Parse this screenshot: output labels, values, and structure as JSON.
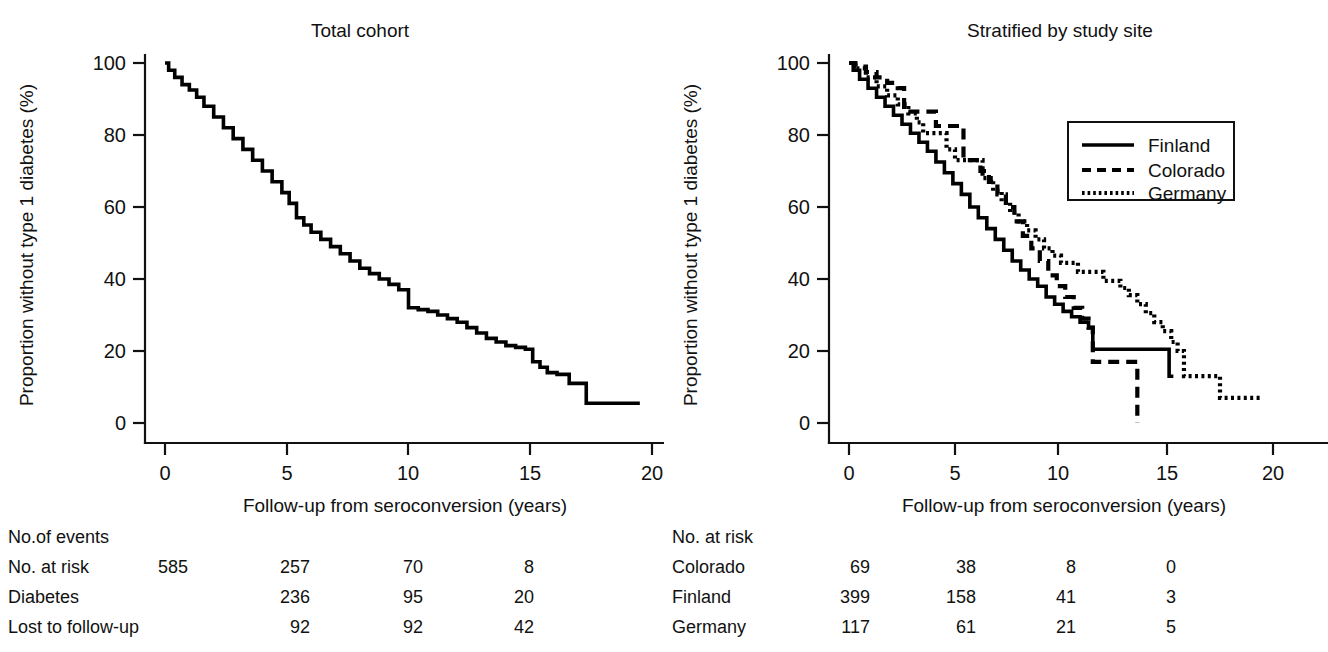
{
  "figure": {
    "axis_label_x": "Follow-up from seroconversion (years)",
    "axis_label_y": "Proportion without type 1 diabetes (%)",
    "x_ticks": [
      "0",
      "5",
      "10",
      "15",
      "20"
    ],
    "y_ticks": [
      "0",
      "20",
      "40",
      "60",
      "80",
      "100"
    ]
  },
  "panels": [
    {
      "title": "Total cohort",
      "risk_table": {
        "header": "No.of events",
        "rows": [
          {
            "label": "No. at risk",
            "values": [
              "585",
              "257",
              "70",
              "8"
            ]
          },
          {
            "label": "Diabetes",
            "values": [
              "",
              "236",
              "95",
              "20"
            ]
          },
          {
            "label": "Lost to follow-up",
            "values": [
              "",
              "92",
              "92",
              "42"
            ]
          }
        ]
      }
    },
    {
      "title": "Stratified by study site",
      "legend": [
        {
          "label": "Finland",
          "style": "solid"
        },
        {
          "label": "Colorado",
          "style": "dashed"
        },
        {
          "label": "Germany",
          "style": "dotted"
        }
      ],
      "risk_table": {
        "header": "No. at risk",
        "rows": [
          {
            "label": "Colorado",
            "values": [
              "69",
              "38",
              "8",
              "0"
            ]
          },
          {
            "label": "Finland",
            "values": [
              "399",
              "158",
              "41",
              "3"
            ]
          },
          {
            "label": "Germany",
            "values": [
              "117",
              "61",
              "21",
              "5"
            ]
          }
        ]
      }
    }
  ],
  "chart_data": [
    {
      "type": "line",
      "title": "Total cohort",
      "xlabel": "Follow-up from seroconversion (years)",
      "ylabel": "Proportion without type 1 diabetes (%)",
      "xlim": [
        0,
        20.5
      ],
      "ylim": [
        0,
        100
      ],
      "grid": false,
      "legend": "none",
      "series": [
        {
          "name": "Total cohort",
          "style": "solid",
          "x": [
            0,
            0.15,
            0.4,
            0.7,
            1,
            1.3,
            1.6,
            2,
            2.4,
            2.8,
            3.2,
            3.6,
            4,
            4.4,
            4.8,
            5.1,
            5.4,
            5.7,
            6,
            6.4,
            6.8,
            7.2,
            7.6,
            8,
            8.4,
            8.8,
            9.2,
            9.6,
            10,
            10.4,
            10.8,
            11.2,
            11.6,
            12,
            12.4,
            12.8,
            13.2,
            13.6,
            14,
            14.4,
            14.8,
            15.1,
            15.4,
            15.7,
            16.1,
            16.6,
            17.1,
            17.3,
            18,
            19.5
          ],
          "y": [
            100,
            98,
            96,
            94,
            92.5,
            90.5,
            88,
            85,
            82,
            79,
            76,
            73,
            70,
            67,
            64,
            61,
            57,
            55,
            53,
            51,
            49,
            47,
            45,
            43,
            41.5,
            40,
            38.5,
            37,
            32,
            31.5,
            31,
            30,
            29,
            28,
            26.5,
            25,
            23.5,
            22.5,
            21.5,
            21,
            20.5,
            17,
            15.5,
            14,
            13.5,
            11,
            11,
            5.5,
            5.5,
            5.5
          ]
        }
      ]
    },
    {
      "type": "line",
      "title": "Stratified by study site",
      "xlabel": "Follow-up from seroconversion (years)",
      "ylabel": "Proportion without type 1 diabetes (%)",
      "xlim": [
        0,
        20.5
      ],
      "ylim": [
        0,
        100
      ],
      "grid": false,
      "legend": "top-right",
      "series": [
        {
          "name": "Finland",
          "style": "solid",
          "x": [
            0,
            0.2,
            0.5,
            0.9,
            1.3,
            1.7,
            2.1,
            2.5,
            2.9,
            3.3,
            3.7,
            4.1,
            4.5,
            4.9,
            5.3,
            5.7,
            6.1,
            6.5,
            6.9,
            7.3,
            7.7,
            8.1,
            8.5,
            8.9,
            9.3,
            9.7,
            10.1,
            10.5,
            10.9,
            11.3,
            11.5,
            15,
            15.1,
            15.3
          ],
          "y": [
            100,
            98,
            95.5,
            93,
            90.5,
            88,
            85.5,
            83,
            80.5,
            78,
            75.5,
            72.5,
            69.5,
            66.5,
            63.5,
            60,
            57,
            54,
            51,
            48,
            45,
            42.5,
            40,
            38,
            35,
            33,
            31,
            29.5,
            28,
            26.5,
            20.5,
            20.5,
            13,
            13
          ]
        },
        {
          "name": "Colorado",
          "style": "dashed",
          "x": [
            0,
            0.3,
            0.8,
            1.3,
            1.8,
            2.3,
            2.6,
            3,
            3.4,
            3.7,
            4.1,
            4.4,
            4.7,
            5,
            5.4,
            5.8,
            6.2,
            6.6,
            7,
            7.4,
            7.8,
            8.2,
            8.6,
            9,
            9.4,
            9.8,
            10.2,
            10.6,
            11,
            11.3,
            11.5,
            13.5,
            13.6
          ],
          "y": [
            100,
            99,
            97.5,
            96,
            94.5,
            93,
            86.5,
            86.5,
            86.5,
            86.5,
            82.5,
            82.5,
            82.5,
            82.5,
            73,
            73,
            70,
            67,
            63.5,
            60,
            56,
            52,
            48.5,
            45,
            41,
            38,
            35,
            32,
            29,
            26.5,
            17,
            17,
            0
          ]
        },
        {
          "name": "Germany",
          "style": "dotted",
          "x": [
            0,
            0.3,
            0.8,
            1.3,
            1.8,
            2.3,
            2.8,
            3.2,
            3.5,
            3.8,
            4.2,
            4.6,
            5,
            5.5,
            6,
            6.3,
            6.8,
            7.2,
            7.6,
            8,
            8.4,
            8.8,
            9.2,
            9.6,
            10,
            10.4,
            10.8,
            11.2,
            11.6,
            12,
            12.4,
            12.8,
            13.2,
            13.6,
            14,
            14.4,
            14.8,
            15.2,
            15.5,
            15.8,
            17.3,
            17.5,
            19.5
          ],
          "y": [
            100,
            98.5,
            96,
            93.5,
            91,
            88.5,
            86,
            83.5,
            80.5,
            80.5,
            80.5,
            76,
            73,
            73,
            73,
            68,
            64.5,
            61.5,
            58.5,
            56,
            53.5,
            51,
            48.5,
            46.5,
            44.5,
            44.5,
            42,
            42,
            42,
            39.5,
            39.5,
            37.5,
            35.5,
            33,
            30.5,
            28,
            25.5,
            22.5,
            20,
            13,
            13,
            7,
            7
          ]
        }
      ]
    }
  ]
}
